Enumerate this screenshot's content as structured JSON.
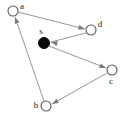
{
  "figure": {
    "type": "directed-graph",
    "width": 127,
    "height": 118,
    "background_color": "#ffffff",
    "edge_color": "#8a8a8a",
    "node_outline_color": "#5a5a5a",
    "node_fill_open": "#ffffff",
    "node_fill_source": "#0a0a0a",
    "label_color": "#1a1a1a"
  },
  "nodes": [
    {
      "id": "a",
      "label": "a",
      "cx": 13,
      "cy": 11,
      "r": 5,
      "filled": false,
      "label_x": 22,
      "label_y": 7
    },
    {
      "id": "d",
      "label": "d",
      "cx": 91,
      "cy": 30,
      "r": 5,
      "filled": false,
      "label_x": 100,
      "label_y": 25
    },
    {
      "id": "s",
      "label": "s",
      "cx": 44,
      "cy": 43,
      "r": 5.5,
      "filled": true,
      "label_x": 41,
      "label_y": 32
    },
    {
      "id": "c",
      "label": "c",
      "cx": 112,
      "cy": 70,
      "r": 5,
      "filled": false,
      "label_x": 111,
      "label_y": 82
    },
    {
      "id": "b",
      "label": "b",
      "cx": 46,
      "cy": 106,
      "r": 5,
      "filled": false,
      "label_x": 36,
      "label_y": 106
    }
  ],
  "edges": [
    {
      "id": "a-d",
      "from": "a",
      "to": "d",
      "x1": 18,
      "y1": 12,
      "x2": 85,
      "y2": 29,
      "arrow_angle_deg": 14
    },
    {
      "id": "d-s",
      "from": "d",
      "to": "s",
      "x1": 86,
      "y1": 33,
      "x2": 51,
      "y2": 42,
      "arrow_angle_deg": 194
    },
    {
      "id": "s-c",
      "from": "s",
      "to": "c",
      "x1": 49,
      "y1": 46,
      "x2": 106,
      "y2": 68,
      "arrow_angle_deg": 21
    },
    {
      "id": "c-b",
      "from": "c",
      "to": "b",
      "x1": 107,
      "y1": 73,
      "x2": 52,
      "y2": 104,
      "arrow_angle_deg": 151
    },
    {
      "id": "b-a",
      "from": "b",
      "to": "a",
      "x1": 44,
      "y1": 101,
      "x2": 15,
      "y2": 17,
      "arrow_angle_deg": 251
    }
  ]
}
